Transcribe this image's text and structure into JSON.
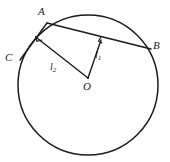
{
  "figure": {
    "type": "geometry-diagram",
    "stroke_color": "#1a1a1a",
    "background_color": "#ffffff",
    "circle": {
      "center_x": 88,
      "center_y": 85,
      "radius": 70,
      "stroke_width": 1.5
    },
    "points": {
      "A": {
        "x": 47,
        "y": 23,
        "label": "A",
        "label_x": 38,
        "label_y": 6
      },
      "B": {
        "x": 151,
        "y": 49,
        "label": "B",
        "label_x": 153,
        "label_y": 40
      },
      "C": {
        "x": 20,
        "y": 60,
        "label": "C",
        "label_x": 5,
        "label_y": 52
      },
      "O": {
        "x": 88,
        "y": 78,
        "label": "O",
        "label_x": 83,
        "label_y": 81
      },
      "F1": {
        "x": 101,
        "y": 40
      },
      "F2": {
        "x": 37,
        "y": 38
      }
    },
    "segments": [
      {
        "name": "chord-AB",
        "from": "A",
        "to": "B"
      },
      {
        "name": "chord-AC",
        "from": "A",
        "to": "C"
      },
      {
        "name": "perpendicular-l1",
        "from": "O",
        "to": "F1"
      },
      {
        "name": "perpendicular-l2",
        "from": "O",
        "to": "F2"
      }
    ],
    "segment_labels": {
      "l1": {
        "text": "l",
        "subscript": "1",
        "x": 95,
        "y": 50
      },
      "l2": {
        "text": "l",
        "subscript": "2",
        "x": 50,
        "y": 62
      }
    },
    "right_angle_markers": [
      {
        "name": "right-angle-at-F1",
        "x": 101,
        "y": 40
      },
      {
        "name": "right-angle-at-F2",
        "x": 37,
        "y": 38
      }
    ]
  }
}
